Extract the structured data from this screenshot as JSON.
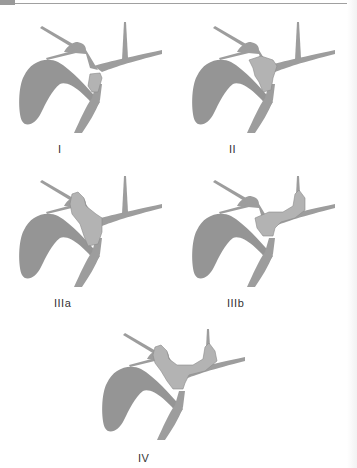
{
  "figure": {
    "colors": {
      "duct": "#9d9d9d",
      "gallbladder": "#959595",
      "tumor": "#b3b3b3",
      "label": "#333333"
    }
  },
  "panels": [
    {
      "id": "I",
      "label": "I",
      "tumor_extent": "common hepatic duct below confluence"
    },
    {
      "id": "II",
      "label": "II",
      "tumor_extent": "involves confluence"
    },
    {
      "id": "IIIa",
      "label": "IIIa",
      "tumor_extent": "confluence + right hepatic duct"
    },
    {
      "id": "IIIb",
      "label": "IIIb",
      "tumor_extent": "confluence + left hepatic duct"
    },
    {
      "id": "IV",
      "label": "IV",
      "tumor_extent": "confluence + both hepatic ducts"
    }
  ]
}
